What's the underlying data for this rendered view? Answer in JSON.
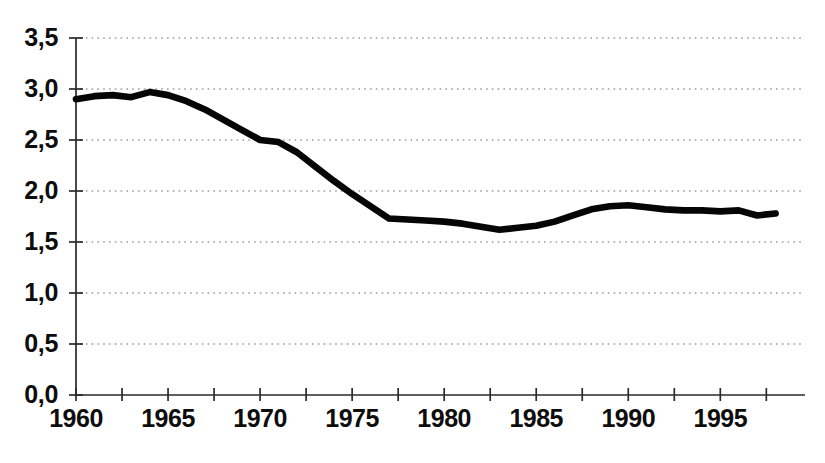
{
  "chart_data": {
    "type": "line",
    "title": "",
    "subtitle": "",
    "xlabel": "",
    "ylabel": "",
    "xlim": [
      1960,
      1999.6
    ],
    "ylim": [
      0.0,
      3.5
    ],
    "grid": true,
    "legend": null,
    "decimal_separator": ",",
    "y_ticks": [
      0.0,
      0.5,
      1.0,
      1.5,
      2.0,
      2.5,
      3.0,
      3.5
    ],
    "y_tick_labels": [
      "0,0",
      "0,5",
      "1,0",
      "1,5",
      "2,0",
      "2,5",
      "3,0",
      "3,5"
    ],
    "x_ticks": [
      1960,
      1965,
      1970,
      1975,
      1980,
      1985,
      1990,
      1995
    ],
    "x_tick_labels": [
      "1960",
      "1965",
      "1970",
      "1975",
      "1980",
      "1985",
      "1990",
      "1995"
    ],
    "x_minor_tick_step": 2.5,
    "x": [
      1960,
      1961,
      1962,
      1963,
      1964,
      1965,
      1966,
      1967,
      1968,
      1969,
      1970,
      1971,
      1972,
      1973,
      1974,
      1975,
      1976,
      1977,
      1978,
      1979,
      1980,
      1981,
      1982,
      1983,
      1984,
      1985,
      1986,
      1987,
      1988,
      1989,
      1990,
      1991,
      1992,
      1993,
      1994,
      1995,
      1996,
      1997,
      1998
    ],
    "values": [
      2.9,
      2.93,
      2.94,
      2.92,
      2.97,
      2.94,
      2.88,
      2.8,
      2.7,
      2.6,
      2.5,
      2.48,
      2.38,
      2.24,
      2.1,
      1.97,
      1.85,
      1.73,
      1.72,
      1.71,
      1.7,
      1.68,
      1.65,
      1.62,
      1.64,
      1.66,
      1.7,
      1.76,
      1.82,
      1.85,
      1.86,
      1.84,
      1.82,
      1.81,
      1.81,
      1.8,
      1.81,
      1.76,
      1.78
    ],
    "series": [
      {
        "name": "series-1",
        "color": "#050505",
        "line_width": 6.6,
        "values": [
          2.9,
          2.93,
          2.94,
          2.92,
          2.97,
          2.94,
          2.88,
          2.8,
          2.7,
          2.6,
          2.5,
          2.48,
          2.38,
          2.24,
          2.1,
          1.97,
          1.85,
          1.73,
          1.72,
          1.71,
          1.7,
          1.68,
          1.65,
          1.62,
          1.64,
          1.66,
          1.7,
          1.76,
          1.82,
          1.85,
          1.86,
          1.84,
          1.82,
          1.81,
          1.81,
          1.8,
          1.81,
          1.76,
          1.78
        ]
      }
    ],
    "annotations": []
  },
  "plot_geometry": {
    "left": 76,
    "right": 805,
    "top": 38,
    "bottom": 395
  },
  "colors": {
    "background": "#ffffff",
    "axis": "#2a2a2a",
    "grid": "#6d6d6d",
    "line": "#050505",
    "text": "#0d0d0d"
  }
}
